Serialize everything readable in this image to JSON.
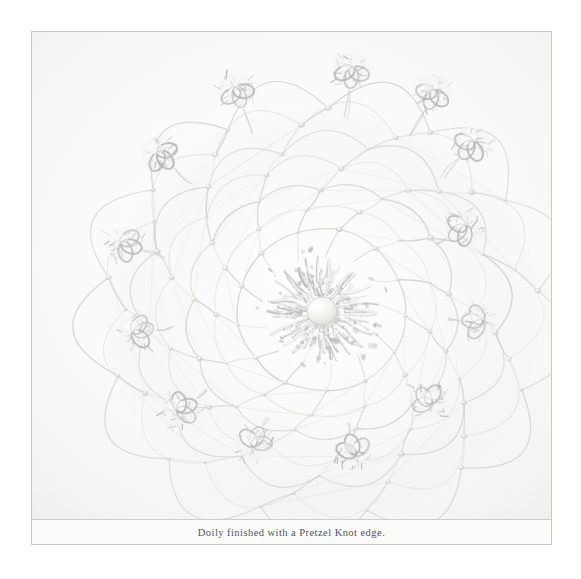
{
  "plate": {
    "caption": "Doily finished with a Pretzel Knot edge.",
    "subject": "crochet doily",
    "background_label": "white paper backdrop"
  },
  "colors": {
    "page_background": "#ffffff",
    "plate_background": "#fbfbfa",
    "frame_rule": "#c9c9c9",
    "caption_rule": "#cdcdcd",
    "caption_text": "#54545c",
    "thread_light": "#e6e6e4",
    "thread_mid": "#d2d2d0",
    "thread_shadow": "#b4b4b2",
    "center_button": "#f6f6f4"
  },
  "doily": {
    "title": "Doily with Pretzel Knot edge",
    "center": {
      "cx": 290,
      "cy": 279,
      "button_radius": 15
    },
    "rosette": {
      "label": "dense crochet rosette centre",
      "petal_rings": [
        {
          "radius": 30,
          "count": 26,
          "length": 16
        },
        {
          "radius": 42,
          "count": 30,
          "length": 20
        },
        {
          "radius": 54,
          "count": 34,
          "length": 22
        }
      ]
    },
    "net": {
      "label": "spiral mesh net ground",
      "spiral_arms": 13,
      "rounds": 7,
      "inner_radius": 58,
      "outer_radius": 212
    },
    "edge_motifs": {
      "name": "pretzel-knot",
      "count": 13,
      "radius": 26,
      "points": [
        {
          "x": 320,
          "y": 38
        },
        {
          "x": 402,
          "y": 60
        },
        {
          "x": 440,
          "y": 112
        },
        {
          "x": 432,
          "y": 196
        },
        {
          "x": 448,
          "y": 290
        },
        {
          "x": 398,
          "y": 370
        },
        {
          "x": 322,
          "y": 420
        },
        {
          "x": 222,
          "y": 412
        },
        {
          "x": 148,
          "y": 378
        },
        {
          "x": 104,
          "y": 300
        },
        {
          "x": 92,
          "y": 212
        },
        {
          "x": 128,
          "y": 122
        },
        {
          "x": 204,
          "y": 58
        }
      ]
    }
  }
}
